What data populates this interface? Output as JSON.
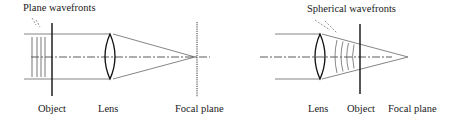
{
  "diagram": {
    "left": {
      "title_label": "Plane wavefronts",
      "labels": {
        "object": "Object",
        "lens": "Lens",
        "focal_plane": "Focal plane"
      }
    },
    "right": {
      "title_label": "Spherical wavefronts",
      "labels": {
        "lens": "Lens",
        "object": "Object",
        "focal_plane": "Focal plane"
      }
    },
    "colors": {
      "ink": "#1a1a1a",
      "ray": "#555555"
    }
  }
}
